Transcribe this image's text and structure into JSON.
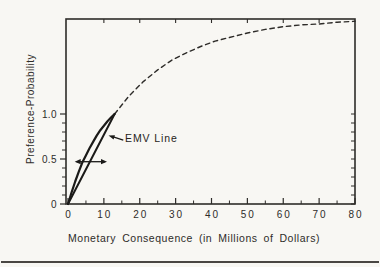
{
  "figure": {
    "kind": "scanned textbook chart",
    "background_color": "#f8f7f3",
    "ink_color": "#2e2c29",
    "lens_color": "#1b1a18",
    "bottom_rule_color": "#4a4743"
  },
  "chart_data": {
    "type": "line",
    "title": "",
    "xlabel": "Monetary Consequence (in Millions of Dollars)",
    "ylabel": "Preference-Probability",
    "x_range": [
      0,
      80
    ],
    "y_ticked_range": [
      0,
      1.0
    ],
    "y_frame_top": 2.06,
    "grid": false,
    "legend": null,
    "x_major_ticks": [
      0,
      10,
      20,
      30,
      40,
      50,
      60,
      70,
      80
    ],
    "x_tick_labels": [
      "0",
      "10",
      "20",
      "30",
      "40",
      "50",
      "60",
      "70",
      "80"
    ],
    "x_minor_step": 5,
    "top_axis_ticks": [
      10,
      20,
      30,
      40,
      50,
      60,
      70
    ],
    "y_major_ticks": [
      0,
      0.5,
      1.0
    ],
    "y_tick_labels": [
      "0",
      "0.5",
      "1.0"
    ],
    "y_minor_step": 0.1,
    "series": [
      {
        "name": "preference-curve-extrapolated",
        "style": "dashed",
        "points": [
          [
            13,
            1.0
          ],
          [
            17,
            1.2
          ],
          [
            21,
            1.36
          ],
          [
            25,
            1.49
          ],
          [
            29,
            1.6
          ],
          [
            33,
            1.68
          ],
          [
            37,
            1.75
          ],
          [
            41,
            1.81
          ],
          [
            45,
            1.85
          ],
          [
            50,
            1.9
          ],
          [
            55,
            1.94
          ],
          [
            60,
            1.97
          ],
          [
            65,
            1.99
          ],
          [
            70,
            2.0
          ],
          [
            75,
            2.02
          ],
          [
            80,
            2.03
          ]
        ]
      },
      {
        "name": "preference-curve-assessed",
        "style": "solid",
        "points": [
          [
            0,
            0
          ],
          [
            1,
            0.13
          ],
          [
            2,
            0.25
          ],
          [
            3,
            0.36
          ],
          [
            4,
            0.46
          ],
          [
            5,
            0.54
          ],
          [
            6,
            0.62
          ],
          [
            7,
            0.69
          ],
          [
            8,
            0.76
          ],
          [
            9,
            0.82
          ],
          [
            10,
            0.87
          ],
          [
            11,
            0.92
          ],
          [
            12,
            0.96
          ],
          [
            13,
            1.0
          ]
        ]
      },
      {
        "name": "emv-line",
        "style": "solid",
        "points": [
          [
            0,
            0
          ],
          [
            13,
            1.0
          ]
        ]
      }
    ],
    "annotations": {
      "emv_label": {
        "text": "EMV Line",
        "arrow_tip": [
          11.3,
          0.76
        ],
        "arrow_tail": [
          15.4,
          0.71
        ]
      },
      "gap_arrow": {
        "description": "double-headed horizontal arrow across the lens between preference curve and EMV line",
        "y": 0.47,
        "x_from": 1.87,
        "x_to": 10.87
      }
    }
  }
}
